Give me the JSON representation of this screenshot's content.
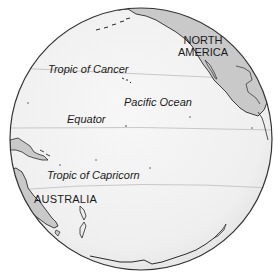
{
  "map": {
    "type": "orthographic-globe",
    "colors": {
      "ocean": "#f2f2f2",
      "ocean_edge": "#e4e4e4",
      "land": "#c9c9c9",
      "coastline": "#2a2a2a",
      "latitude_line": "#b9b9b9",
      "globe_outline": "#333333",
      "text": "#1a1a1a"
    },
    "labels": {
      "north_america": [
        "NORTH",
        "AMERICA"
      ],
      "tropic_of_cancer": "Tropic of Cancer",
      "pacific_ocean": "Pacific Ocean",
      "equator": "Equator",
      "tropic_of_capricorn": "Tropic of Capricorn",
      "australia": "AUSTRALIA"
    },
    "latitude_lines": [
      "Tropic of Cancer",
      "Equator",
      "Tropic of Capricorn"
    ]
  }
}
